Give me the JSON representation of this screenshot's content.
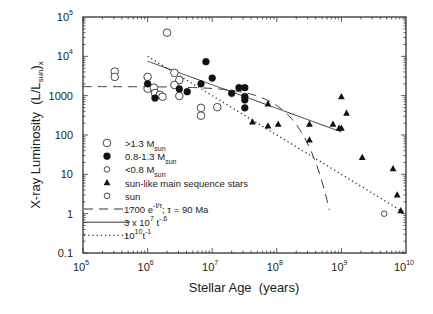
{
  "chart_data": {
    "type": "scatter",
    "title": "",
    "xlabel": "Stellar Age  (years)",
    "ylabel": "X-ray Luminosity  (L/L",
    "ylabel_sub": "sun",
    "ylabel_tail": ")",
    "ylabel_sub2": "x",
    "xscale": "log",
    "yscale": "log",
    "xlim": [
      100000,
      10000000000
    ],
    "ylim": [
      0.1,
      100000
    ],
    "x_ticks": [
      {
        "base": "10",
        "exp": "5",
        "value": 100000
      },
      {
        "base": "10",
        "exp": "6",
        "value": 1000000
      },
      {
        "base": "10",
        "exp": "7",
        "value": 10000000
      },
      {
        "base": "10",
        "exp": "8",
        "value": 100000000
      },
      {
        "base": "10",
        "exp": "9",
        "value": 1000000000
      },
      {
        "base": "10",
        "exp": "10",
        "value": 10000000000
      }
    ],
    "y_ticks": [
      {
        "label": "0.1",
        "exp": "",
        "value": 0.1
      },
      {
        "label": "1",
        "exp": "",
        "value": 1
      },
      {
        "label": "10",
        "exp": "",
        "value": 10
      },
      {
        "label": "100",
        "exp": "",
        "value": 100
      },
      {
        "label": "1000",
        "exp": "",
        "value": 1000
      },
      {
        "label": "10",
        "exp": "4",
        "value": 10000
      },
      {
        "label": "10",
        "exp": "5",
        "value": 100000
      }
    ],
    "grid": false,
    "legend_position": "lower-left",
    "series": [
      {
        "name": ">1.3 M",
        "name_sub": "sun",
        "marker": "open-circle-large",
        "points": [
          [
            2000000,
            40000
          ],
          [
            310000,
            4100
          ],
          [
            310000,
            3000
          ],
          [
            1000000,
            3000
          ],
          [
            1000000,
            1500
          ],
          [
            1250000,
            1600
          ],
          [
            1300000,
            1170
          ],
          [
            1550000,
            1050
          ],
          [
            1700000,
            940
          ],
          [
            2600000,
            3800
          ],
          [
            3100000,
            2500
          ],
          [
            2600000,
            1870
          ],
          [
            3100000,
            980
          ],
          [
            6700000,
            490
          ],
          [
            6700000,
            310
          ],
          [
            12000000,
            510
          ]
        ]
      },
      {
        "name": "0.8-1.3  M",
        "name_sub": "sun",
        "marker": "filled-circle",
        "points": [
          [
            1000000,
            2000
          ],
          [
            1300000,
            870
          ],
          [
            3100000,
            1480
          ],
          [
            4100000,
            1260
          ],
          [
            8000000,
            7300
          ],
          [
            10000000,
            2800
          ],
          [
            6700000,
            2000
          ],
          [
            20000000,
            1150
          ],
          [
            26000000,
            1600
          ],
          [
            32000000,
            1600
          ],
          [
            32000000,
            950
          ],
          [
            32000000,
            780
          ],
          [
            32000000,
            490
          ]
        ]
      },
      {
        "name": "<0.8 M",
        "name_sub": "sun",
        "marker": "open-circle-small",
        "points": []
      },
      {
        "name": "sun-like main sequence stars",
        "name_sub": "",
        "marker": "filled-triangle",
        "points": [
          [
            42000000,
            215
          ],
          [
            73000000,
            620
          ],
          [
            73000000,
            170
          ],
          [
            105000000,
            190
          ],
          [
            320000000,
            190
          ],
          [
            320000000,
            75
          ],
          [
            740000000,
            190
          ],
          [
            920000000,
            150
          ],
          [
            1000000000,
            150
          ],
          [
            1000000000,
            940
          ],
          [
            1200000000,
            360
          ],
          [
            2100000000,
            27
          ],
          [
            6300000000,
            14
          ],
          [
            7300000000,
            3.0
          ],
          [
            8300000000,
            1.2
          ]
        ]
      },
      {
        "name": "sun",
        "name_sub": "",
        "marker": "open-circle-small",
        "points": [
          [
            4600000000,
            1.0
          ]
        ]
      }
    ],
    "curves": [
      {
        "name": "1700  e",
        "name_sup": "-t/τ",
        "name_tail": "; τ = 90  Ma",
        "style": "dashed",
        "formula": "1700*exp(-t/9e7)",
        "x_range": [
          100000,
          650000000
        ]
      },
      {
        "name": "3 x 10",
        "name_sup": "7",
        "name_tail": " t",
        "name_sup2": "-.6",
        "style": "solid",
        "formula": "3e7*t^-0.6",
        "x_range": [
          1000000,
          1000000000
        ]
      },
      {
        "name": "10",
        "name_sup": "10",
        "name_tail": "t",
        "name_sup2": "-1",
        "style": "dotted",
        "formula": "1e10*t^-1",
        "x_range": [
          1000000,
          10000000000
        ]
      }
    ]
  }
}
